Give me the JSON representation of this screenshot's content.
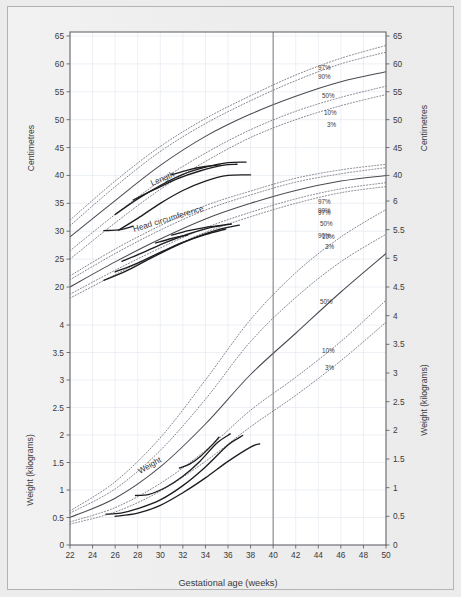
{
  "chart_data": {
    "type": "line",
    "title": "",
    "xlabel": "Gestational age (weeks)",
    "ylabel_left_top": "Centimetres",
    "ylabel_left_bottom": "Weight (kilograms)",
    "ylabel_right_top": "Centimetres",
    "ylabel_right_bottom": "Weight (kilograms)",
    "xlim": [
      22,
      50
    ],
    "xticks": [
      22,
      24,
      26,
      28,
      30,
      32,
      34,
      36,
      38,
      40,
      42,
      44,
      46,
      48,
      50
    ],
    "xtick_labels": [
      "22",
      "24",
      "26",
      "28",
      "30",
      "32",
      "34",
      "36",
      "38",
      "40",
      "42",
      "44",
      "46",
      "48",
      "50"
    ],
    "left_axis_cm_ticks": [
      "65",
      "60",
      "55",
      "50",
      "45",
      "40",
      "35",
      "30",
      "25",
      "20"
    ],
    "left_axis_kg_ticks": [
      "4",
      "3.5",
      "3",
      "2.5",
      "2",
      "1.5",
      "1",
      "0.5",
      "0"
    ],
    "right_axis_cm_ticks": [
      "65",
      "60",
      "55",
      "50",
      "45",
      "40"
    ],
    "right_axis_kg_ticks": [
      "6",
      "5.5",
      "5",
      "4.5",
      "4",
      "3.5",
      "3",
      "2.5",
      "2",
      "1.5",
      "1",
      "0.5",
      "0"
    ],
    "grid": true,
    "legend_position": "inline-right",
    "reference_line_x": 40,
    "percentile_labels": [
      "97%",
      "90%",
      "50%",
      "10%",
      "3%"
    ],
    "curve_labels": [
      "Length",
      "Head circumference",
      "Weight"
    ],
    "groups": [
      {
        "name": "Length",
        "unit": "cm",
        "percentiles": {
          "97": [
            [
              22,
              32.0
            ],
            [
              26,
              39.0
            ],
            [
              30,
              45.2
            ],
            [
              34,
              50.2
            ],
            [
              38,
              54.3
            ],
            [
              42,
              58.0
            ],
            [
              46,
              61.0
            ],
            [
              50,
              63.3
            ]
          ],
          "90": [
            [
              22,
              31.0
            ],
            [
              26,
              38.0
            ],
            [
              30,
              44.3
            ],
            [
              34,
              49.3
            ],
            [
              38,
              53.4
            ],
            [
              42,
              57.0
            ],
            [
              46,
              60.0
            ],
            [
              50,
              62.1
            ]
          ],
          "50": [
            [
              22,
              29.0
            ],
            [
              26,
              35.5
            ],
            [
              30,
              41.8
            ],
            [
              34,
              47.0
            ],
            [
              38,
              51.0
            ],
            [
              42,
              54.2
            ],
            [
              46,
              56.8
            ],
            [
              50,
              58.6
            ]
          ],
          "10": [
            [
              22,
              26.5
            ],
            [
              26,
              33.0
            ],
            [
              30,
              39.0
            ],
            [
              34,
              44.0
            ],
            [
              38,
              48.2
            ],
            [
              42,
              51.5
            ],
            [
              46,
              54.0
            ],
            [
              50,
              56.0
            ]
          ],
          "3": [
            [
              22,
              25.0
            ],
            [
              26,
              31.5
            ],
            [
              30,
              37.5
            ],
            [
              34,
              42.5
            ],
            [
              38,
              46.8
            ],
            [
              42,
              50.0
            ],
            [
              46,
              52.5
            ],
            [
              50,
              54.5
            ]
          ]
        }
      },
      {
        "name": "Head circumference",
        "unit": "cm",
        "percentiles": {
          "97": [
            [
              22,
              22.0
            ],
            [
              26,
              26.8
            ],
            [
              30,
              31.0
            ],
            [
              34,
              34.6
            ],
            [
              38,
              37.2
            ],
            [
              42,
              39.5
            ],
            [
              46,
              41.0
            ],
            [
              50,
              42.0
            ]
          ],
          "90": [
            [
              22,
              21.3
            ],
            [
              26,
              26.0
            ],
            [
              30,
              30.2
            ],
            [
              34,
              33.8
            ],
            [
              38,
              36.5
            ],
            [
              42,
              38.8
            ],
            [
              46,
              40.3
            ],
            [
              50,
              41.4
            ]
          ],
          "50": [
            [
              22,
              20.0
            ],
            [
              26,
              24.5
            ],
            [
              30,
              28.6
            ],
            [
              34,
              32.2
            ],
            [
              38,
              35.0
            ],
            [
              42,
              37.3
            ],
            [
              46,
              39.0
            ],
            [
              50,
              40.0
            ]
          ],
          "10": [
            [
              22,
              18.7
            ],
            [
              26,
              23.0
            ],
            [
              30,
              27.0
            ],
            [
              34,
              30.6
            ],
            [
              38,
              33.4
            ],
            [
              42,
              35.8
            ],
            [
              46,
              37.6
            ],
            [
              50,
              38.7
            ]
          ],
          "3": [
            [
              22,
              18.0
            ],
            [
              26,
              22.2
            ],
            [
              30,
              26.2
            ],
            [
              34,
              29.8
            ],
            [
              38,
              32.6
            ],
            [
              42,
              35.0
            ],
            [
              46,
              36.9
            ],
            [
              50,
              38.0
            ]
          ]
        }
      },
      {
        "name": "Weight",
        "unit": "kg",
        "percentiles": {
          "97": [
            [
              22,
              0.62
            ],
            [
              26,
              1.15
            ],
            [
              30,
              1.95
            ],
            [
              34,
              3.0
            ],
            [
              38,
              4.1
            ],
            [
              42,
              4.95
            ],
            [
              46,
              5.6
            ],
            [
              50,
              6.1
            ]
          ],
          "90": [
            [
              22,
              0.58
            ],
            [
              26,
              1.02
            ],
            [
              30,
              1.72
            ],
            [
              34,
              2.65
            ],
            [
              38,
              3.7
            ],
            [
              42,
              4.5
            ],
            [
              46,
              5.15
            ],
            [
              50,
              5.65
            ]
          ],
          "50": [
            [
              22,
              0.5
            ],
            [
              26,
              0.85
            ],
            [
              30,
              1.42
            ],
            [
              34,
              2.2
            ],
            [
              38,
              3.1
            ],
            [
              42,
              3.85
            ],
            [
              46,
              4.6
            ],
            [
              50,
              5.3
            ]
          ],
          "10": [
            [
              22,
              0.42
            ],
            [
              26,
              0.68
            ],
            [
              30,
              1.12
            ],
            [
              34,
              1.72
            ],
            [
              38,
              2.45
            ],
            [
              42,
              3.05
            ],
            [
              46,
              3.7
            ],
            [
              50,
              4.45
            ]
          ],
          "3": [
            [
              22,
              0.38
            ],
            [
              26,
              0.6
            ],
            [
              30,
              0.98
            ],
            [
              34,
              1.52
            ],
            [
              38,
              2.15
            ],
            [
              42,
              2.72
            ],
            [
              46,
              3.35
            ],
            [
              50,
              4.05
            ]
          ]
        }
      }
    ],
    "patient_tracks_note": "solid short dark segments overlaid on percentile bands"
  },
  "axes": {
    "x_title": "Gestational age (weeks)",
    "left_top_title": "Centimetres",
    "left_bottom_title": "Weight (kilograms)",
    "right_top_title": "Centimetres",
    "right_bottom_title": "Weight (kilograms)"
  },
  "labels": {
    "length": "Length",
    "head_circumference": "Head circumference",
    "weight": "Weight",
    "p97": "97%",
    "p90": "90%",
    "p50": "50%",
    "p10": "10%",
    "p3": "3%"
  },
  "colors": {
    "background": "#ececed",
    "plot_background": "#ffffff",
    "axis": "#555555",
    "grid": "#e4e8ef",
    "percentile_line": "#6f6f78",
    "median_line": "#4a4a52",
    "patient_track": "#1d1d20",
    "text": "#3a3a3a"
  }
}
